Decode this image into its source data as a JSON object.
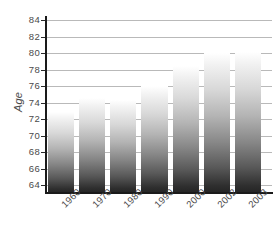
{
  "chart_data": {
    "type": "bar",
    "title": "",
    "subtitle": "",
    "xlabel": "",
    "ylabel": "Age",
    "categories": [
      "1960",
      "1970",
      "1980",
      "1990",
      "2000",
      "2002",
      "2003"
    ],
    "values": [
      72.9,
      74.6,
      74.3,
      76.0,
      78.4,
      80.0,
      80.1
    ],
    "series": [
      {
        "name": "Age",
        "values": [
          72.9,
          74.6,
          74.3,
          76.0,
          78.4,
          80.0,
          80.1
        ]
      }
    ],
    "ylim": [
      63,
      84
    ],
    "ytick_values": [
      64,
      66,
      68,
      70,
      72,
      74,
      76,
      78,
      80,
      82,
      84
    ],
    "ytick_labels": [
      "64",
      "66",
      "68",
      "70",
      "72",
      "74",
      "76",
      "78",
      "80",
      "82",
      "84"
    ],
    "grid": "horizontal",
    "legend": "none",
    "bar_style": "vertical-gradient-grayscale",
    "colors": {
      "bar_top": "#ffffff",
      "bar_bottom": "#242424",
      "gridline": "#b9b9b9",
      "axis": "#1a1a1a",
      "text": "#4a4a4a",
      "background": "#ffffff"
    }
  }
}
